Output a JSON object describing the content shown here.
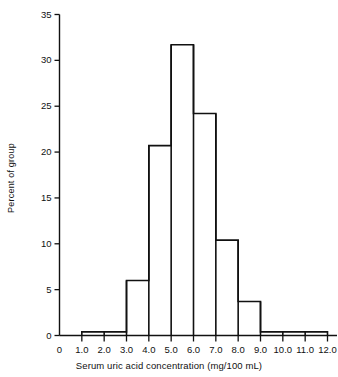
{
  "chart_data": {
    "type": "bar",
    "title": "",
    "xlabel": "Serum uric acid concentration (mg/100 mL)",
    "ylabel": "Percent of group",
    "xlim": [
      0,
      12.0
    ],
    "ylim": [
      0,
      35
    ],
    "grid": false,
    "legend": null,
    "bin_width": 1.0,
    "bin_edges": [
      1.0,
      2.0,
      3.0,
      4.0,
      5.0,
      6.0,
      7.0,
      8.0,
      9.0,
      10.0,
      11.0,
      12.0
    ],
    "categories": [
      "1.0-2.0",
      "2.0-3.0",
      "3.0-4.0",
      "4.0-5.0",
      "5.0-6.0",
      "6.0-7.0",
      "7.0-8.0",
      "8.0-9.0",
      "9.0-10.0",
      "10.0-11.0",
      "11.0-12.0"
    ],
    "values": [
      0.4,
      0.4,
      6.0,
      20.7,
      31.7,
      24.2,
      10.4,
      3.7,
      0.4,
      0.4,
      0.4
    ],
    "xticks": [
      0,
      1.0,
      2.0,
      3.0,
      4.0,
      5.0,
      6.0,
      7.0,
      8.0,
      9.0,
      10.0,
      11.0,
      12.0
    ],
    "xtick_labels": [
      "0",
      "1.0",
      "2.0",
      "3.0",
      "4.0",
      "5.0",
      "6.0",
      "7.0",
      "8.0",
      "9.0",
      "10.0",
      "11.0",
      "12.0"
    ],
    "yticks": [
      0,
      5,
      10,
      15,
      20,
      25,
      30,
      35
    ],
    "ytick_labels": [
      "0",
      "5",
      "10",
      "15",
      "20",
      "25",
      "30",
      "35"
    ],
    "bar_style": "outline",
    "bar_color": "#111111"
  }
}
